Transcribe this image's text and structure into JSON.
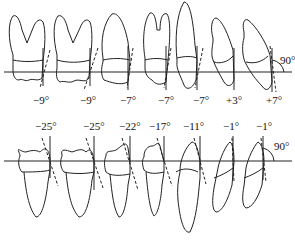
{
  "diagram": {
    "upper_arch": {
      "reference_angle_label": "90°",
      "teeth": [
        {
          "type": "molar",
          "angle_label": "−9°"
        },
        {
          "type": "molar",
          "angle_label": "−9°"
        },
        {
          "type": "premolar",
          "angle_label": "−7°"
        },
        {
          "type": "premolar",
          "angle_label": "−7°"
        },
        {
          "type": "canine",
          "angle_label": "−7°"
        },
        {
          "type": "lateral-incisor",
          "angle_label": "+3°"
        },
        {
          "type": "central-incisor",
          "angle_label": "+7°"
        }
      ]
    },
    "lower_arch": {
      "reference_angle_label": "90°",
      "teeth": [
        {
          "type": "molar",
          "angle_label": "−25°"
        },
        {
          "type": "molar",
          "angle_label": "−25°"
        },
        {
          "type": "premolar",
          "angle_label": "−22°"
        },
        {
          "type": "premolar",
          "angle_label": "−17°"
        },
        {
          "type": "canine",
          "angle_label": "−11°"
        },
        {
          "type": "lateral-incisor",
          "angle_label": "−1°"
        },
        {
          "type": "central-incisor",
          "angle_label": "−1°"
        }
      ]
    }
  }
}
